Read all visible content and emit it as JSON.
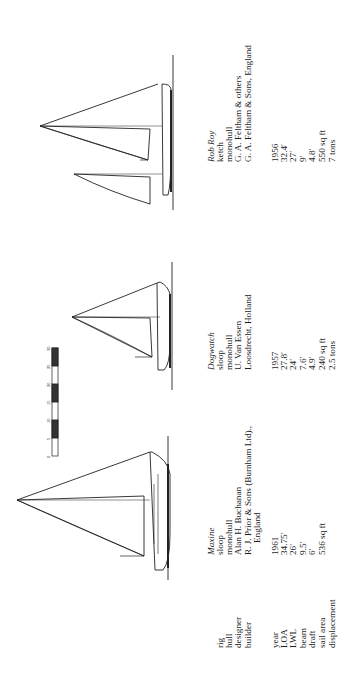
{
  "scale_bar": {
    "unit_marks": [
      "0",
      "5",
      "10",
      "15",
      "20",
      "25",
      "30"
    ]
  },
  "labels": {
    "rig": "rig",
    "hull": "hull",
    "designer": "designer",
    "builder": "builder",
    "year": "year",
    "loa": "LOA",
    "lwl": "LWL",
    "beam": "beam",
    "draft": "draft",
    "sail_area": "sail area",
    "displacement": "displacement"
  },
  "boats": [
    {
      "name": "Maxine",
      "rig": "sloop",
      "hull": "monohull",
      "designer": "Alan H. Buchanan",
      "builder": "R. J. Prior & Sons (Burnham Ltd).,",
      "builder_line2": "England",
      "year": "1961",
      "loa": "34.75′",
      "lwl": "26′",
      "beam": "9.5′",
      "draft": "6′",
      "sail_area": "536 sq ft",
      "displacement": ""
    },
    {
      "name": "Dogwatch",
      "rig": "sloop",
      "hull": "monohull",
      "designer": "U. Van Essen",
      "builder": "Loosdrecht, Holland",
      "builder_line2": "",
      "year": "1957",
      "loa": "27.8′",
      "lwl": "24′",
      "beam": "7.6′",
      "draft": "4.9′",
      "sail_area": "240 sq ft",
      "displacement": "2.5 tons"
    },
    {
      "name": "Rob Roy",
      "rig": "ketch",
      "hull": "monohull",
      "designer": "G. A. Feltham & others",
      "builder": "G. A. Feltham & Sons, England",
      "builder_line2": "",
      "year": "1956",
      "loa": "32.4′",
      "lwl": "27′",
      "beam": "9′",
      "draft": "4.8′",
      "sail_area": "550 sq ft",
      "displacement": "7 tons"
    }
  ]
}
